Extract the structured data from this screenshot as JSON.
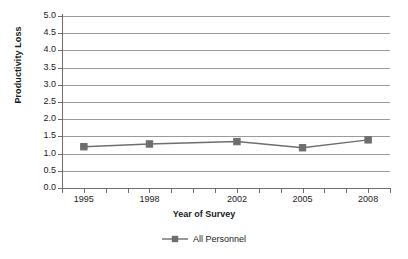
{
  "chart_data": {
    "type": "line",
    "title": "",
    "xlabel": "Year of Survey",
    "ylabel": "Productivity Loss",
    "x": [
      1995,
      1998,
      2002,
      2005,
      2008
    ],
    "categories": [
      "1995",
      "1998",
      "2002",
      "2005",
      "2008"
    ],
    "series": [
      {
        "name": "All Personnel",
        "values": [
          1.2,
          1.28,
          1.35,
          1.17,
          1.4
        ],
        "color": "#6e6e6e",
        "marker": "square"
      }
    ],
    "ylim": [
      0.0,
      5.0
    ],
    "ytick_step": 0.5,
    "yticks": [
      "0.0",
      "0.5",
      "1.0",
      "1.5",
      "2.0",
      "2.5",
      "3.0",
      "3.5",
      "4.0",
      "4.5",
      "5.0"
    ],
    "ytick_values": [
      0.0,
      0.5,
      1.0,
      1.5,
      2.0,
      2.5,
      3.0,
      3.5,
      4.0,
      4.5,
      5.0
    ],
    "xlim": [
      1994,
      2009
    ],
    "xtick_values": [
      1994,
      1995,
      1996,
      1997,
      1998,
      1999,
      2000,
      2001,
      2002,
      2003,
      2004,
      2005,
      2006,
      2007,
      2008,
      2009
    ],
    "grid": "horizontal",
    "legend_position": "bottom",
    "legend": [
      "All Personnel"
    ],
    "gridline_color": "#9a9a9a",
    "axis_color": "#6e6e6e",
    "background": "#ffffff"
  }
}
